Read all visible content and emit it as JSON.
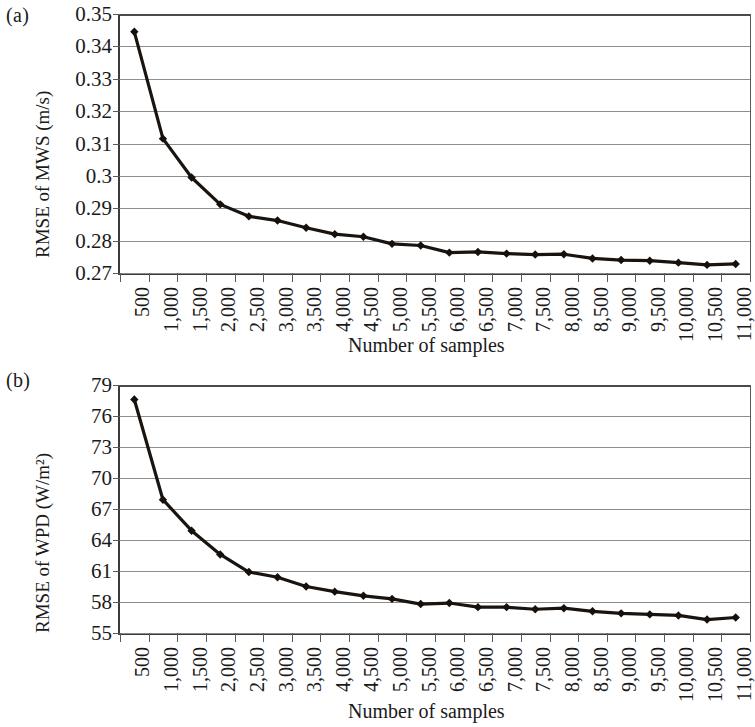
{
  "figure": {
    "panels": [
      {
        "tag": "(a)",
        "ylabel": "RMSE of MWS (m/s)",
        "xlabel": "Number of samples"
      },
      {
        "tag": "(b)",
        "ylabel": "RMSE of WPD (W/m²)",
        "xlabel": "Number of samples"
      }
    ]
  },
  "chart_data": [
    {
      "type": "line",
      "panel": "(a)",
      "title": "",
      "xlabel": "Number of samples",
      "ylabel": "RMSE of MWS (m/s)",
      "categories": [
        "500",
        "1,000",
        "1,500",
        "2,000",
        "2,500",
        "3,000",
        "3,500",
        "4,000",
        "4,500",
        "5,000",
        "5,500",
        "6,000",
        "6,500",
        "7,000",
        "7,500",
        "8,000",
        "8,500",
        "9,000",
        "9,500",
        "10,000",
        "10,500",
        "11,000"
      ],
      "x": [
        500,
        1000,
        1500,
        2000,
        2500,
        3000,
        3500,
        4000,
        4500,
        5000,
        5500,
        6000,
        6500,
        7000,
        7500,
        8000,
        8500,
        9000,
        9500,
        10000,
        10500,
        11000
      ],
      "values": [
        0.3445,
        0.3115,
        0.2995,
        0.2912,
        0.2875,
        0.2862,
        0.284,
        0.282,
        0.2812,
        0.279,
        0.2785,
        0.2763,
        0.2765,
        0.276,
        0.2757,
        0.2758,
        0.2745,
        0.274,
        0.2738,
        0.2732,
        0.2725,
        0.2728
      ],
      "yticks": [
        0.27,
        0.28,
        0.29,
        0.3,
        0.31,
        0.32,
        0.33,
        0.34,
        0.35
      ],
      "ytick_labels": [
        "0.27",
        "0.28",
        "0.29",
        "0.3",
        "0.31",
        "0.32",
        "0.33",
        "0.34",
        "0.35"
      ],
      "ylim": [
        0.27,
        0.35
      ],
      "grid": true,
      "legend": "none",
      "marker": "diamond",
      "line_color": "#1a1410"
    },
    {
      "type": "line",
      "panel": "(b)",
      "title": "",
      "xlabel": "Number of samples",
      "ylabel": "RMSE of WPD (W/m²)",
      "categories": [
        "500",
        "1,000",
        "1,500",
        "2,000",
        "2,500",
        "3,000",
        "3,500",
        "4,000",
        "4,500",
        "5,000",
        "5,500",
        "6,000",
        "6,500",
        "7,000",
        "7,500",
        "8,000",
        "8,500",
        "9,000",
        "9,500",
        "10,000",
        "10,500",
        "11,000"
      ],
      "x": [
        500,
        1000,
        1500,
        2000,
        2500,
        3000,
        3500,
        4000,
        4500,
        5000,
        5500,
        6000,
        6500,
        7000,
        7500,
        8000,
        8500,
        9000,
        9500,
        10000,
        10500,
        11000
      ],
      "values": [
        77.6,
        67.9,
        64.9,
        62.6,
        60.9,
        60.4,
        59.5,
        59.0,
        58.6,
        58.3,
        57.8,
        57.9,
        57.5,
        57.5,
        57.3,
        57.4,
        57.1,
        56.9,
        56.8,
        56.7,
        56.3,
        56.5
      ],
      "yticks": [
        55,
        58,
        61,
        64,
        67,
        70,
        73,
        76,
        79
      ],
      "ytick_labels": [
        "55",
        "58",
        "61",
        "64",
        "67",
        "70",
        "73",
        "76",
        "79"
      ],
      "ylim": [
        55,
        79
      ],
      "grid": true,
      "legend": "none",
      "marker": "diamond",
      "line_color": "#1a1410"
    }
  ]
}
